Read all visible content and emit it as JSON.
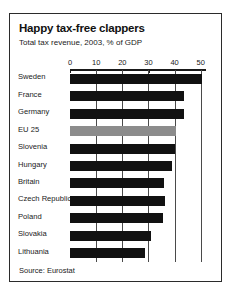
{
  "chart_data": {
    "type": "bar",
    "orientation": "horizontal",
    "title": "Happy tax-free clappers",
    "subtitle": "Total tax revenue, 2003, % of GDP",
    "source": "Source: Eurostat",
    "xlabel": "",
    "ylabel": "",
    "xlim": [
      0,
      52
    ],
    "ticks": [
      0,
      10,
      20,
      30,
      40,
      50
    ],
    "gridlines": [
      10,
      20,
      30,
      40,
      50
    ],
    "grid": true,
    "legend": "none",
    "bar_color": "#111111",
    "highlight_color": "#8c8c8c",
    "categories": [
      "Sweden",
      "France",
      "Germany",
      "EU 25",
      "Slovenia",
      "Hungary",
      "Britain",
      "Czech Republic",
      "Poland",
      "Slovakia",
      "Lithuania"
    ],
    "values": [
      50.5,
      43.4,
      43.6,
      40.5,
      40.1,
      39.1,
      36.1,
      36.3,
      35.7,
      31.1,
      28.5
    ],
    "highlighted": [
      "EU 25"
    ]
  }
}
